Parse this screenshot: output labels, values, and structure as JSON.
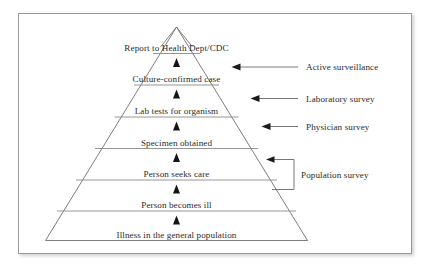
{
  "figure": {
    "border_color": "#9a9a9a",
    "background": "#ffffff",
    "text_color": "#2a2a2a",
    "line_color": "#6f6f6f",
    "arrow_color": "#1a1a1a"
  },
  "pyramid": {
    "apex_icon": "triangle-apex-icon",
    "levels": [
      {
        "id": "level-7",
        "label": "Report to Health Dept/CDC",
        "rank": 7
      },
      {
        "id": "level-6",
        "label": "Culture-confirmed case",
        "rank": 6
      },
      {
        "id": "level-5",
        "label": "Lab tests for organism",
        "rank": 5
      },
      {
        "id": "level-4",
        "label": "Specimen obtained",
        "rank": 4
      },
      {
        "id": "level-3",
        "label": "Person seeks care",
        "rank": 3
      },
      {
        "id": "level-2",
        "label": "Person becomes ill",
        "rank": 2
      },
      {
        "id": "level-1",
        "label": "Illness in the general population",
        "rank": 1
      }
    ],
    "step_arrow_icon": "up-triangle-icon",
    "step_arrow_count": 6
  },
  "annotations": [
    {
      "id": "annotation-active-surveillance",
      "label": "Active surveillance",
      "connector": "arrow-left",
      "targets_level": "level-6"
    },
    {
      "id": "annotation-laboratory-survey",
      "label": "Laboratory survey",
      "connector": "arrow-left",
      "targets_level": "level-5"
    },
    {
      "id": "annotation-physician-survey",
      "label": "Physician survey",
      "connector": "arrow-left",
      "targets_level": "level-4"
    },
    {
      "id": "annotation-population-survey",
      "label": "Population survey",
      "connector": "bracket-arrow-left",
      "targets_level": "level-3,level-2"
    }
  ]
}
